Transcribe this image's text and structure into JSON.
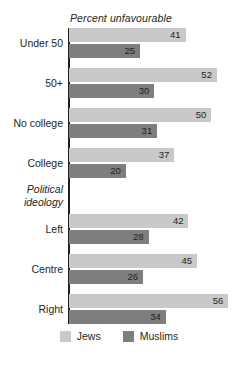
{
  "chart_data": {
    "type": "bar",
    "orientation": "horizontal",
    "title": "Percent unfavourable",
    "xlabel": "",
    "ylabel": "",
    "xlim": [
      0,
      56
    ],
    "grid": false,
    "legend_position": "bottom",
    "categories": [
      "Under 50",
      "50+",
      "No college",
      "College",
      "Left",
      "Centre",
      "Right"
    ],
    "section_headings": [
      {
        "after_category": "College",
        "text_line1": "Political",
        "text_line2": "ideology"
      }
    ],
    "series": [
      {
        "name": "Jews",
        "color": "#c9c9c9",
        "values": [
          41,
          52,
          50,
          37,
          42,
          45,
          56
        ]
      },
      {
        "name": "Muslims",
        "color": "#7e7e7e",
        "values": [
          25,
          30,
          31,
          20,
          28,
          26,
          34
        ]
      }
    ]
  },
  "legend": {
    "items": [
      {
        "label": "Jews",
        "swatch": "light"
      },
      {
        "label": "Muslims",
        "swatch": "dark"
      }
    ]
  },
  "labels": {
    "cat0": "Under 50",
    "cat1": "50+",
    "cat2": "No college",
    "cat3": "College",
    "cat4": "Left",
    "cat5": "Centre",
    "cat6": "Right",
    "section_line1": "Political",
    "section_line2": "ideology"
  },
  "values": {
    "jews0": "41",
    "muslims0": "25",
    "jews1": "52",
    "muslims1": "30",
    "jews2": "50",
    "muslims2": "31",
    "jews3": "37",
    "muslims3": "20",
    "jews4": "42",
    "muslims4": "28",
    "jews5": "45",
    "muslims5": "26",
    "jews6": "56",
    "muslims6": "34"
  }
}
